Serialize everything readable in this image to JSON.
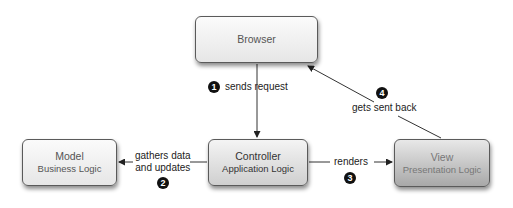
{
  "diagram": {
    "nodes": [
      {
        "id": "browser",
        "title": "Browser",
        "subtitle": ""
      },
      {
        "id": "model",
        "title": "Model",
        "subtitle": "Business Logic"
      },
      {
        "id": "controller",
        "title": "Controller",
        "subtitle": "Application Logic"
      },
      {
        "id": "view",
        "title": "View",
        "subtitle": "Presentation Logic"
      }
    ],
    "edges": [
      {
        "step": "1",
        "from": "browser",
        "to": "controller",
        "label": "sends request"
      },
      {
        "step": "2",
        "from": "controller",
        "to": "model",
        "label_line1": "gathers data",
        "label_line2": "and updates"
      },
      {
        "step": "3",
        "from": "controller",
        "to": "view",
        "label": "renders"
      },
      {
        "step": "4",
        "from": "view",
        "to": "browser",
        "label": "gets sent back"
      }
    ]
  }
}
